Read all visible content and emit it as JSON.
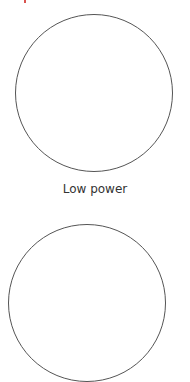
{
  "colors": {
    "circle_border": "#555555",
    "label_text": "#333333",
    "accent_fragment": "#d9534f",
    "background": "#ffffff"
  },
  "options": [
    {
      "label": "Low power",
      "icon": "circle-option-icon"
    },
    {
      "label": "",
      "icon": "circle-option-icon"
    }
  ]
}
